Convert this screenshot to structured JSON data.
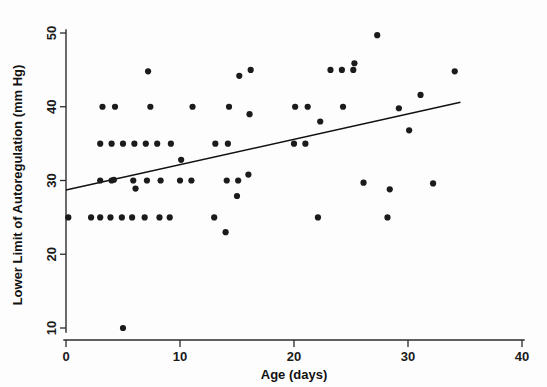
{
  "chart_data": {
    "type": "scatter",
    "title": "",
    "xlabel": "Age (days)",
    "ylabel": "Lower Limit of Autoregulation (mm Hg)",
    "xlim": [
      0,
      40
    ],
    "ylim": [
      8.5,
      51
    ],
    "xticks": [
      0,
      10,
      20,
      30,
      40
    ],
    "xtick_labels": [
      "0",
      "10",
      "20",
      "30",
      "40"
    ],
    "yticks": [
      10,
      20,
      30,
      40,
      50
    ],
    "ytick_labels": [
      "10",
      "20",
      "30",
      "40",
      "50"
    ],
    "grid": false,
    "legend": "none",
    "marker": "filled-circle",
    "marker_color": "#1b1b1b",
    "points": [
      {
        "x": 0.2,
        "y": 25.0
      },
      {
        "x": 2.2,
        "y": 25.0
      },
      {
        "x": 3.0,
        "y": 25.0
      },
      {
        "x": 3.0,
        "y": 30.0
      },
      {
        "x": 3.0,
        "y": 35.0
      },
      {
        "x": 3.2,
        "y": 40.0
      },
      {
        "x": 3.9,
        "y": 25.0
      },
      {
        "x": 4.0,
        "y": 30.0
      },
      {
        "x": 4.0,
        "y": 35.0
      },
      {
        "x": 4.2,
        "y": 30.1
      },
      {
        "x": 4.3,
        "y": 40.0
      },
      {
        "x": 4.9,
        "y": 25.0
      },
      {
        "x": 5.0,
        "y": 35.0
      },
      {
        "x": 5.0,
        "y": 10.0
      },
      {
        "x": 5.8,
        "y": 25.0
      },
      {
        "x": 5.9,
        "y": 30.0
      },
      {
        "x": 6.0,
        "y": 35.0
      },
      {
        "x": 6.1,
        "y": 28.9
      },
      {
        "x": 6.9,
        "y": 25.0
      },
      {
        "x": 7.0,
        "y": 35.0
      },
      {
        "x": 7.1,
        "y": 30.0
      },
      {
        "x": 7.2,
        "y": 44.8
      },
      {
        "x": 7.4,
        "y": 40.0
      },
      {
        "x": 8.0,
        "y": 35.0
      },
      {
        "x": 8.2,
        "y": 25.0
      },
      {
        "x": 8.3,
        "y": 30.0
      },
      {
        "x": 9.1,
        "y": 25.0
      },
      {
        "x": 9.2,
        "y": 35.0
      },
      {
        "x": 10.0,
        "y": 30.0
      },
      {
        "x": 10.1,
        "y": 32.8
      },
      {
        "x": 11.0,
        "y": 30.0
      },
      {
        "x": 11.1,
        "y": 40.0
      },
      {
        "x": 13.0,
        "y": 25.0
      },
      {
        "x": 13.1,
        "y": 35.0
      },
      {
        "x": 14.0,
        "y": 23.0
      },
      {
        "x": 14.1,
        "y": 30.0
      },
      {
        "x": 14.2,
        "y": 35.0
      },
      {
        "x": 14.3,
        "y": 40.0
      },
      {
        "x": 15.0,
        "y": 27.9
      },
      {
        "x": 15.1,
        "y": 30.0
      },
      {
        "x": 15.2,
        "y": 44.2
      },
      {
        "x": 16.0,
        "y": 30.8
      },
      {
        "x": 16.1,
        "y": 39.0
      },
      {
        "x": 16.2,
        "y": 45.0
      },
      {
        "x": 20.0,
        "y": 35.0
      },
      {
        "x": 20.1,
        "y": 40.0
      },
      {
        "x": 21.0,
        "y": 35.0
      },
      {
        "x": 21.2,
        "y": 40.0
      },
      {
        "x": 22.1,
        "y": 25.0
      },
      {
        "x": 22.3,
        "y": 38.0
      },
      {
        "x": 23.2,
        "y": 45.0
      },
      {
        "x": 24.2,
        "y": 45.0
      },
      {
        "x": 24.3,
        "y": 40.0
      },
      {
        "x": 25.2,
        "y": 45.0
      },
      {
        "x": 25.3,
        "y": 45.9
      },
      {
        "x": 26.1,
        "y": 29.7
      },
      {
        "x": 27.3,
        "y": 49.7
      },
      {
        "x": 28.2,
        "y": 25.0
      },
      {
        "x": 28.4,
        "y": 28.8
      },
      {
        "x": 29.2,
        "y": 39.8
      },
      {
        "x": 30.1,
        "y": 36.8
      },
      {
        "x": 31.1,
        "y": 41.6
      },
      {
        "x": 32.2,
        "y": 29.6
      },
      {
        "x": 34.1,
        "y": 44.8
      }
    ],
    "fit_line": {
      "type": "linear-regression",
      "x_start": 0.0,
      "y_start": 28.7,
      "x_end": 34.6,
      "y_end": 40.6
    }
  }
}
